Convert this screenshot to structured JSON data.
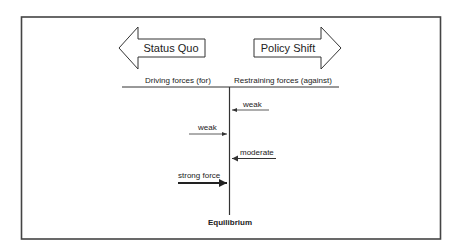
{
  "diagram": {
    "type": "force-field-analysis",
    "colors": {
      "stroke": "#333333",
      "frame": "#444444",
      "text": "#222222",
      "background": "#ffffff"
    },
    "direction_arrows": {
      "left": {
        "label": "Status Quo"
      },
      "right": {
        "label": "Policy Shift"
      }
    },
    "column_headers": {
      "left": "Driving forces (for)",
      "right": "Restraining forces (against)"
    },
    "forces": [
      {
        "side": "restraining",
        "label": "weak",
        "strength": "weak"
      },
      {
        "side": "driving",
        "label": "weak",
        "strength": "weak"
      },
      {
        "side": "restraining",
        "label": "moderate",
        "strength": "moderate"
      },
      {
        "side": "driving",
        "label": "strong force",
        "strength": "strong"
      }
    ],
    "center_label": "Equilibrium"
  }
}
